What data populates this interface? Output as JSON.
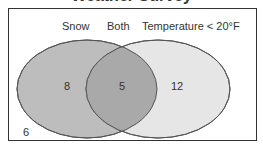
{
  "title": "Weather Survey",
  "diagram": {
    "type": "venn",
    "sets": [
      {
        "name": "Snow",
        "only_count": 8
      },
      {
        "name": "Temperature < 20°F",
        "only_count": 12
      }
    ],
    "intersection": {
      "label": "Both",
      "count": 5
    },
    "outside": {
      "count": 6
    }
  },
  "labels": {
    "snow": "Snow",
    "both": "Both",
    "temperature": "Temperature < 20°F",
    "snow_only": "8",
    "both_count": "5",
    "temp_only": "12",
    "neither": "6"
  },
  "colors": {
    "snow_fill": "#bdbdbd",
    "temp_fill": "#e6e6e6",
    "intersection_fill": "#a9a9a9",
    "stroke": "#555555"
  }
}
